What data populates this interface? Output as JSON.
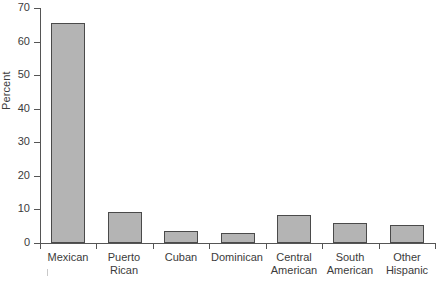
{
  "chart_data": {
    "type": "bar",
    "title": "",
    "xlabel": "",
    "ylabel": "Percent",
    "ylim": [
      0,
      70
    ],
    "yticks": [
      0,
      10,
      20,
      30,
      40,
      50,
      60,
      70
    ],
    "ytick_labels": [
      "0",
      "10",
      "20",
      "30",
      "40",
      "50",
      "60",
      "70"
    ],
    "grid": false,
    "legend": null,
    "categories": [
      "Mexican",
      "Puerto Rican",
      "Cuban",
      "Dominican",
      "Central American",
      "South American",
      "Other Hispanic"
    ],
    "category_label_lines": [
      [
        "Mexican"
      ],
      [
        "Puerto",
        "Rican"
      ],
      [
        "Cuban"
      ],
      [
        "Dominican"
      ],
      [
        "Central",
        "American"
      ],
      [
        "South",
        "American"
      ],
      [
        "Other",
        "Hispanic"
      ]
    ],
    "values": [
      65.5,
      9.2,
      3.5,
      3.0,
      8.4,
      6.1,
      5.3
    ],
    "bar_fill_color": "#b4b4b4",
    "bar_edge_color": "#4a4a4a",
    "axis_color": "#555555",
    "text_color": "#3b3b3b",
    "background_color": "#ffffff"
  }
}
